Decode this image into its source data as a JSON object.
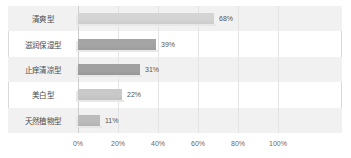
{
  "chart_data": {
    "type": "bar",
    "orientation": "horizontal",
    "title": "",
    "xlabel": "",
    "ylabel": "",
    "categories": [
      "清爽型",
      "滋润保湿型",
      "止痒清凉型",
      "美白型",
      "天然植物型"
    ],
    "values": [
      68,
      39,
      31,
      22,
      11
    ],
    "value_labels": [
      "68%",
      "39%",
      "31%",
      "22%",
      "11%"
    ],
    "xlim": [
      0,
      100
    ],
    "xticks": [
      0,
      20,
      40,
      60,
      80,
      100
    ],
    "xtick_labels": [
      "0%",
      "20%",
      "40%",
      "60%",
      "80%",
      "100%"
    ],
    "grid": true,
    "legend": false,
    "bar_colors": [
      "#d4d4d4",
      "#a5a5a5",
      "#a0a0a0",
      "#c9c9c9",
      "#bcbcbc"
    ],
    "row_band_color": "#f1f1f1",
    "frame_color": "#d9d9d9",
    "gridline_color": "#e4e4e4",
    "label_color": "#4a4a4a",
    "tick_color": "#6a6a6a"
  }
}
